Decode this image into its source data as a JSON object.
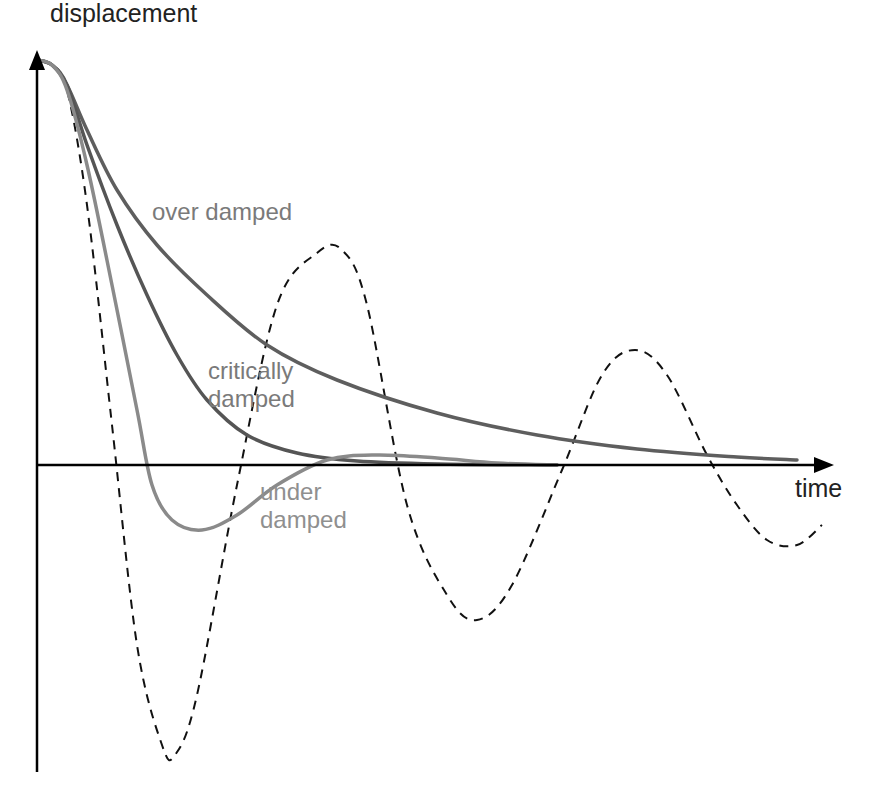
{
  "title": "",
  "axes": {
    "y_label": "displacement",
    "x_label": "time",
    "axis_color": "#000000"
  },
  "labels": {
    "over_damped": "over damped",
    "critically_line1": "critically",
    "critically_line2": "damped",
    "under_line1": "under",
    "under_line2": "damped"
  },
  "colors": {
    "over_damped": "#5e5e5e",
    "critically_damped": "#555555",
    "under_damped": "#8a8a8a",
    "undamped_dashed": "#111111",
    "label_over": "#7a7a7a",
    "label_critical": "#7a7a7a",
    "label_under": "#8f8f8f"
  },
  "chart_data": {
    "type": "line",
    "title": "",
    "xlabel": "time",
    "ylabel": "displacement",
    "grid": false,
    "legend": "inline labels",
    "units": "pixel coordinates (origin at y-axis / time-axis crossing, y up)",
    "series": [
      {
        "name": "over damped",
        "style": "solid",
        "points": [
          [
            0,
            405
          ],
          [
            15,
            400
          ],
          [
            30,
            380
          ],
          [
            50,
            335
          ],
          [
            80,
            275
          ],
          [
            120,
            220
          ],
          [
            170,
            170
          ],
          [
            230,
            120
          ],
          [
            300,
            85
          ],
          [
            400,
            52
          ],
          [
            500,
            30
          ],
          [
            600,
            16
          ],
          [
            700,
            8
          ],
          [
            760,
            5
          ]
        ]
      },
      {
        "name": "critically damped",
        "style": "solid",
        "points": [
          [
            0,
            405
          ],
          [
            15,
            400
          ],
          [
            30,
            380
          ],
          [
            50,
            320
          ],
          [
            80,
            240
          ],
          [
            110,
            170
          ],
          [
            140,
            110
          ],
          [
            170,
            65
          ],
          [
            210,
            30
          ],
          [
            260,
            12
          ],
          [
            320,
            4
          ],
          [
            400,
            1
          ],
          [
            520,
            0
          ]
        ]
      },
      {
        "name": "under damped",
        "style": "solid",
        "points": [
          [
            0,
            405
          ],
          [
            15,
            400
          ],
          [
            30,
            375
          ],
          [
            50,
            300
          ],
          [
            75,
            180
          ],
          [
            100,
            55
          ],
          [
            115,
            -20
          ],
          [
            135,
            -55
          ],
          [
            165,
            -65
          ],
          [
            200,
            -50
          ],
          [
            240,
            -20
          ],
          [
            290,
            5
          ],
          [
            340,
            10
          ],
          [
            400,
            7
          ],
          [
            460,
            2
          ],
          [
            520,
            0
          ]
        ]
      },
      {
        "name": "undamped (no damping)",
        "style": "dashed",
        "points": [
          [
            0,
            405
          ],
          [
            15,
            400
          ],
          [
            30,
            375
          ],
          [
            50,
            260
          ],
          [
            75,
            40
          ],
          [
            100,
            -180
          ],
          [
            125,
            -280
          ],
          [
            138,
            -290
          ],
          [
            160,
            -230
          ],
          [
            200,
            -20
          ],
          [
            240,
            160
          ],
          [
            280,
            212
          ],
          [
            305,
            215
          ],
          [
            330,
            160
          ],
          [
            370,
            -40
          ],
          [
            410,
            -130
          ],
          [
            440,
            -155
          ],
          [
            475,
            -120
          ],
          [
            525,
            -5
          ],
          [
            565,
            90
          ],
          [
            598,
            115
          ],
          [
            630,
            90
          ],
          [
            670,
            10
          ],
          [
            700,
            -40
          ],
          [
            730,
            -75
          ],
          [
            760,
            -80
          ],
          [
            785,
            -60
          ]
        ]
      }
    ]
  }
}
